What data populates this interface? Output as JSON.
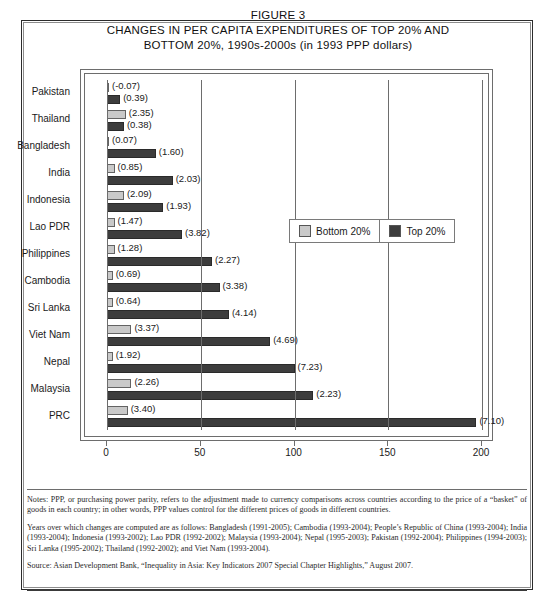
{
  "figure": {
    "title_lines": [
      "FIGURE 3",
      "CHANGES IN PER CAPITA EXPENDITURES OF TOP 20% AND",
      "BOTTOM 20%, 1990s-2000s (in 1993 PPP dollars)"
    ]
  },
  "legend": {
    "position": "inside-upper-right",
    "entries": [
      {
        "label": "Bottom 20%",
        "color": "#c9c9c9"
      },
      {
        "label": "Top 20%",
        "color": "#3d3d3d"
      }
    ]
  },
  "axis": {
    "x_ticks": [
      "0",
      "50",
      "100",
      "150",
      "200"
    ]
  },
  "notes": [
    "Notes: PPP, or purchasing power parity, refers to the adjustment made to currency comparisons across countries according to the price of a “basket” of goods in each country; in other words, PPP values control for the different prices of goods in different countries.",
    "Years over which changes are computed are as follows: Bangladesh (1991-2005); Cambodia (1993-2004); People’s Republic of China (1993-2004); India (1993-2004); Indonesia (1993-2002); Lao PDR (1992-2002); Malaysia (1993-2004); Nepal (1995-2003); Pakistan (1992-2004); Philippines (1994-2003); Sri Lanka (1995-2002); Thailand (1992-2002); and Viet Nam (1993-2004).",
    "Source: Asian Development Bank, “Inequality in Asia: Key Indicators 2007 Special Chapter Highlights,” August 2007."
  ],
  "chart_data": {
    "type": "bar",
    "orientation": "horizontal",
    "title": "CHANGES IN PER CAPITA EXPENDITURES OF TOP 20% AND BOTTOM 20%, 1990s-2000s (in 1993 PPP dollars)",
    "xlabel": "",
    "ylabel": "",
    "xlim": [
      0,
      200
    ],
    "grid": true,
    "grid_axis": "x",
    "legend_position": "upper right inside",
    "categories": [
      "Pakistan",
      "Thailand",
      "Bangladesh",
      "India",
      "Indonesia",
      "Lao PDR",
      "Philippines",
      "Cambodia",
      "Sri Lanka",
      "Viet Nam",
      "Nepal",
      "Malaysia",
      "PRC"
    ],
    "series": [
      {
        "name": "Bottom 20%",
        "color": "#c9c9c9",
        "values": [
          0.5,
          10,
          1,
          4,
          9,
          4,
          4,
          3,
          3,
          13,
          3,
          13,
          11
        ],
        "annotations": [
          "(-0.07)",
          "(2.35)",
          "(0.07)",
          "(0.85)",
          "(2.09)",
          "(1.47)",
          "(1.28)",
          "(0.69)",
          "(0.64)",
          "(3.37)",
          "(1.92)",
          "(2.26)",
          "(3.40)"
        ]
      },
      {
        "name": "Top 20%",
        "color": "#3d3d3d",
        "values": [
          7,
          9,
          26,
          35,
          30,
          40,
          56,
          60,
          65,
          87,
          100,
          110,
          197
        ],
        "annotations": [
          "(0.39)",
          "(0.38)",
          "(1.60)",
          "(2.03)",
          "(1.93)",
          "(3.82)",
          "(2.27)",
          "(3.38)",
          "(4.14)",
          "(4.69)",
          "(7.23)",
          "(2.23)",
          "(7.10)"
        ]
      }
    ],
    "annotation_note": "Parenthetical values are annual average growth rates (%); bar lengths are absolute changes in 1993 PPP dollars."
  }
}
